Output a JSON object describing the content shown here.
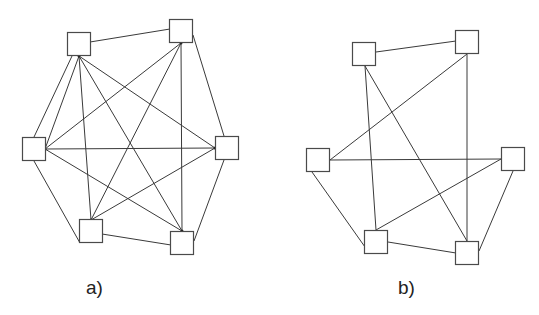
{
  "figure": {
    "colors": {
      "background": "#ffffff",
      "edge": "#3a3a3a",
      "node_stroke": "#4a4a4a",
      "node_fill": "#ffffff",
      "label": "#222222"
    },
    "panels": [
      {
        "id": "a",
        "label": "a)",
        "label_pos": [
          86,
          294
        ],
        "description": "Complete graph K6: 6 square nodes, all 15 pairs connected",
        "node_size": 23,
        "nodes": [
          {
            "id": "TL",
            "x": 79,
            "y": 44
          },
          {
            "id": "TR",
            "x": 181,
            "y": 31
          },
          {
            "id": "L",
            "x": 34,
            "y": 149
          },
          {
            "id": "R",
            "x": 227,
            "y": 148
          },
          {
            "id": "BL",
            "x": 91,
            "y": 231
          },
          {
            "id": "BR",
            "x": 182,
            "y": 243
          }
        ],
        "edges": [
          {
            "from": [
              90,
              42
            ],
            "to": [
              170,
              29
            ]
          },
          {
            "from": [
              193,
              35
            ],
            "to": [
              224,
              136
            ]
          },
          {
            "from": [
              224,
              160
            ],
            "to": [
              194,
              241
            ]
          },
          {
            "from": [
              102,
              234
            ],
            "to": [
              171,
              245
            ]
          },
          {
            "from": [
              80,
              243
            ],
            "to": [
              34,
              161
            ]
          },
          {
            "from": [
              34,
              137
            ],
            "to": [
              72,
              56
            ]
          },
          {
            "from": [
              79,
              56
            ],
            "to": [
              45,
              149
            ]
          },
          {
            "from": [
              79,
              56
            ],
            "to": [
              91,
              220
            ]
          },
          {
            "from": [
              79,
              56
            ],
            "to": [
              182,
              231
            ]
          },
          {
            "from": [
              79,
              56
            ],
            "to": [
              215,
              148
            ]
          },
          {
            "from": [
              181,
              43
            ],
            "to": [
              45,
              149
            ]
          },
          {
            "from": [
              181,
              43
            ],
            "to": [
              91,
              220
            ]
          },
          {
            "from": [
              181,
              43
            ],
            "to": [
              182,
              231
            ]
          },
          {
            "from": [
              45,
              149
            ],
            "to": [
              215,
              148
            ]
          },
          {
            "from": [
              45,
              149
            ],
            "to": [
              182,
              231
            ]
          },
          {
            "from": [
              215,
              148
            ],
            "to": [
              91,
              220
            ]
          }
        ],
        "anchors": [
          [
            79,
            56
          ],
          [
            181,
            43
          ],
          [
            45,
            149
          ],
          [
            215,
            148
          ],
          [
            91,
            220
          ],
          [
            182,
            231
          ]
        ]
      },
      {
        "id": "b",
        "label": "b)",
        "label_pos": [
          398,
          294
        ],
        "description": "Graph on 6 square nodes with 10 edges",
        "node_size": 23,
        "nodes": [
          {
            "id": "TL",
            "x": 364,
            "y": 54
          },
          {
            "id": "TR",
            "x": 467,
            "y": 42
          },
          {
            "id": "L",
            "x": 318,
            "y": 160
          },
          {
            "id": "R",
            "x": 513,
            "y": 159
          },
          {
            "id": "BL",
            "x": 376,
            "y": 242
          },
          {
            "id": "BR",
            "x": 467,
            "y": 253
          }
        ],
        "edges": [
          {
            "from": [
              376,
              52
            ],
            "to": [
              456,
              41
            ]
          },
          {
            "from": [
              365,
              66
            ],
            "to": [
              376,
              230
            ]
          },
          {
            "from": [
              365,
              66
            ],
            "to": [
              467,
              241
            ]
          },
          {
            "from": [
              467,
              54
            ],
            "to": [
              330,
              160
            ]
          },
          {
            "from": [
              467,
              54
            ],
            "to": [
              467,
              241
            ]
          },
          {
            "from": [
              330,
              160
            ],
            "to": [
              501,
              159
            ]
          },
          {
            "from": [
              312,
              172
            ],
            "to": [
              365,
              247
            ]
          },
          {
            "from": [
              501,
              159
            ],
            "to": [
              376,
              230
            ]
          },
          {
            "from": [
              513,
              171
            ],
            "to": [
              479,
              251
            ]
          },
          {
            "from": [
              388,
              242
            ],
            "to": [
              456,
              253
            ]
          }
        ],
        "anchors": []
      }
    ]
  }
}
